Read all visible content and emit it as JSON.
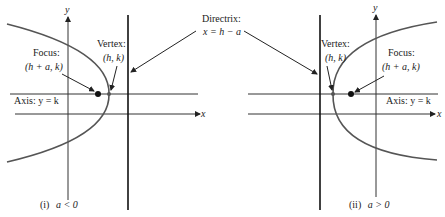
{
  "figure": {
    "shared_label": {
      "title": "Directrix:",
      "equation": "x = h − a"
    },
    "panels": [
      {
        "id": "left",
        "caption": "(i)  a < 0",
        "caption_roman": "(i)",
        "caption_cond": "a < 0",
        "y_axis_label": "y",
        "x_axis_label": "x",
        "focus_title": "Focus:",
        "focus_coords": "(h + a, k)",
        "vertex_title": "Vertex:",
        "vertex_coords": "(h, k)",
        "axis_label": "Axis:  y = k",
        "opens": "left"
      },
      {
        "id": "right",
        "caption": "(ii)  a > 0",
        "caption_roman": "(ii)",
        "caption_cond": "a > 0",
        "y_axis_label": "y",
        "x_axis_label": "x",
        "focus_title": "Focus:",
        "focus_coords": "(h + a, k)",
        "vertex_title": "Vertex:",
        "vertex_coords": "(h, k)",
        "axis_label": "Axis:  y = k",
        "opens": "right"
      }
    ],
    "colors": {
      "curve": "#555555",
      "lines": "#222222",
      "text": "#222222"
    }
  }
}
